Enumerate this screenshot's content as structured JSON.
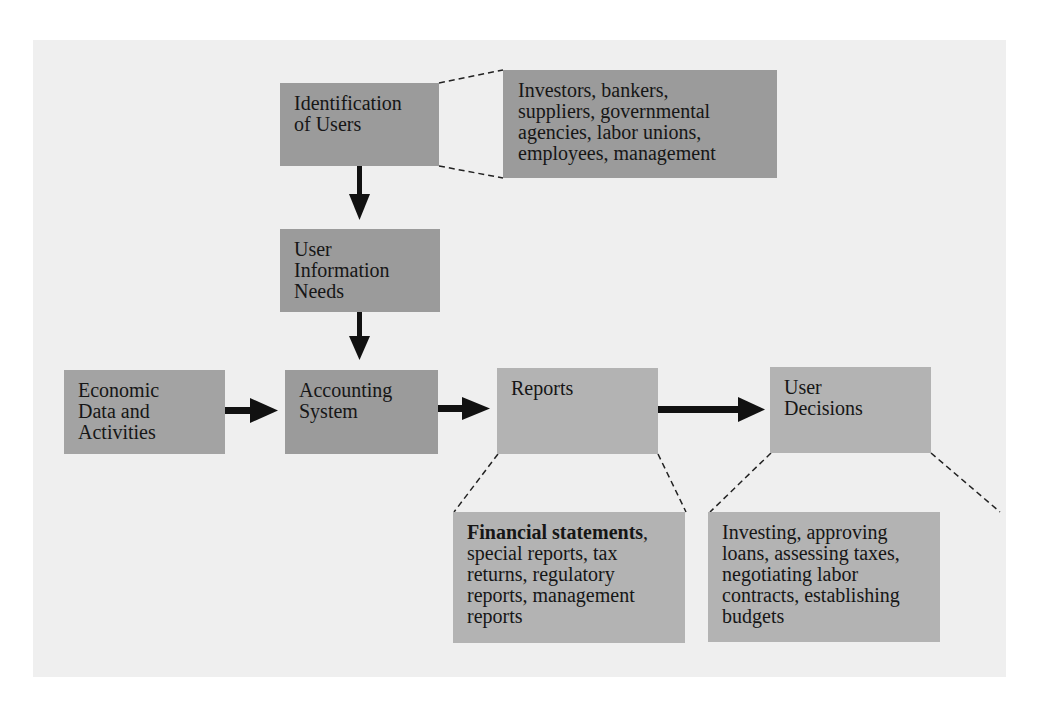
{
  "diagram": {
    "nodes": {
      "identification": {
        "label_line1": "Identification",
        "label_line2": "of Users"
      },
      "users_detail": {
        "lines": [
          "Investors, bankers,",
          "suppliers, governmental",
          "agencies, labor unions,",
          "employees, management"
        ]
      },
      "info_needs": {
        "lines": [
          "User",
          "Information",
          "Needs"
        ]
      },
      "economic": {
        "lines": [
          "Economic",
          "Data and",
          "Activities"
        ]
      },
      "accounting": {
        "lines": [
          "Accounting",
          "System"
        ]
      },
      "reports": {
        "label": "Reports"
      },
      "decisions": {
        "lines": [
          "User",
          "Decisions"
        ]
      },
      "reports_detail": {
        "bold": "Financial statements",
        "rest_line1": ",",
        "lines": [
          "special reports, tax",
          "returns, regulatory",
          "reports, management",
          "reports"
        ]
      },
      "decisions_detail": {
        "lines": [
          "Investing, approving",
          "loans, assessing taxes,",
          "negotiating labor",
          "contracts, establishing",
          "budgets"
        ]
      }
    },
    "edges": [
      {
        "from": "Identification of Users",
        "to": "User Information Needs",
        "style": "solid-arrow"
      },
      {
        "from": "User Information Needs",
        "to": "Accounting System",
        "style": "solid-arrow"
      },
      {
        "from": "Economic Data and Activities",
        "to": "Accounting System",
        "style": "solid-arrow"
      },
      {
        "from": "Accounting System",
        "to": "Reports",
        "style": "solid-arrow"
      },
      {
        "from": "Reports",
        "to": "User Decisions",
        "style": "solid-arrow"
      },
      {
        "from": "Identification of Users",
        "to": "Users detail",
        "style": "dashed-callout"
      },
      {
        "from": "Reports",
        "to": "Reports detail",
        "style": "dashed-callout"
      },
      {
        "from": "User Decisions",
        "to": "Decisions detail",
        "style": "dashed-callout"
      }
    ],
    "colors": {
      "panel": "#efefef",
      "dark_box": "#9b9b9b",
      "light_box": "#b3b3b3",
      "arrow": "#111111"
    }
  }
}
